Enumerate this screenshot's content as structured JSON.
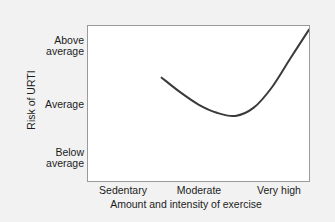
{
  "chart_data": {
    "type": "line",
    "title": "",
    "subtitle": "",
    "xlabel": "Amount and intensity of exercise",
    "ylabel": "Risk of URTI",
    "x_tick_labels": [
      "Sedentary",
      "Moderate",
      "Very high"
    ],
    "y_tick_labels": [
      "Below\naverage",
      "Average",
      "Above\naverage"
    ],
    "y_tick_above_average": "Above\naverage",
    "y_tick_average": "Average",
    "y_tick_below_average": "Below\naverage",
    "x_tick_sedentary": "Sedentary",
    "x_tick_moderate": "Moderate",
    "x_tick_very_high": "Very high",
    "xlim": [
      0,
      3
    ],
    "ylim": [
      0,
      3
    ],
    "grid": false,
    "legend": null,
    "annotations": [],
    "series": [
      {
        "name": "Risk of URTI vs exercise (J-curve)",
        "color": "#3a3a3a",
        "line_width": 2,
        "x": [
          1.0,
          1.25,
          1.5,
          1.75,
          2.0,
          2.25,
          2.5,
          2.75,
          3.0
        ],
        "y": [
          2.0,
          1.72,
          1.48,
          1.32,
          1.26,
          1.42,
          1.82,
          2.38,
          2.93
        ],
        "points": [
          {
            "x_label": "Sedentary",
            "y_label": "Average",
            "note": "curve start"
          },
          {
            "x_label": "Moderate",
            "y_label": "Below average",
            "note": "curve minimum"
          },
          {
            "x_label": "Very high",
            "y_label": "Above average",
            "note": "curve end"
          }
        ]
      }
    ]
  }
}
